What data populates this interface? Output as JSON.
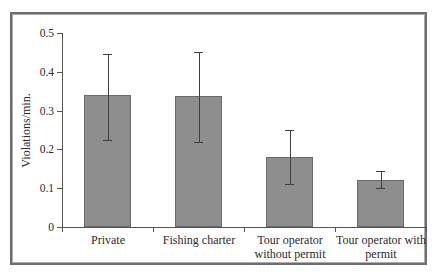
{
  "figure": {
    "background": "#ffffff",
    "frame_outer_color": "#6e6e6e",
    "frame_inner_color": "#acacac"
  },
  "chart_data": {
    "type": "bar",
    "title": "",
    "xlabel": "",
    "ylabel": "Violations/min.",
    "categories": [
      "Private",
      "Fishing charter",
      "Tour operator without permit",
      "Tour operator with permit"
    ],
    "values": [
      0.34,
      0.337,
      0.18,
      0.12
    ],
    "error_high": [
      0.445,
      0.452,
      0.25,
      0.145
    ],
    "error_low": [
      0.225,
      0.22,
      0.112,
      0.1
    ],
    "ylim": [
      0,
      0.5
    ],
    "yticks": [
      0,
      0.1,
      0.2,
      0.3,
      0.4,
      0.5
    ],
    "ytick_labels": [
      "0",
      "0.1",
      "0.2",
      "0.3",
      "0.4",
      "0.5"
    ],
    "grid": false,
    "legend": null,
    "bar_color": "#8e8e8e",
    "bar_border_color": "#6a6a6a",
    "error_bar_color": "#3f3f3f",
    "axis_color": "#555555",
    "text_color": "#2b2b2b"
  }
}
